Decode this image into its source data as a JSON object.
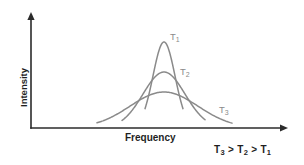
{
  "chart_data": {
    "type": "line",
    "title": "",
    "xlabel": "Frequency",
    "ylabel": "Intensity",
    "grid": false,
    "legend": "inline-curve-labels",
    "axis_style": "arrow-ended L-shaped axes, no tick marks, no numeric scale",
    "annotation": "T3 > T2 > T1",
    "annotation_parts": {
      "t3": "T",
      "t3_sub": "3",
      "op1": " > ",
      "t2": "T",
      "t2_sub": "2",
      "op2": " > ",
      "t1": "T",
      "t1_sub": "1"
    },
    "curve_color": "#8a8a8a",
    "axis_color": "#2b2b2b",
    "background_color": "#ffffff",
    "shared_peak_x": 164,
    "baseline_y": 128,
    "series": [
      {
        "name": "T1",
        "label_text": "T",
        "label_sub": "1",
        "label_x": 170,
        "label_y": 32,
        "peak_y": 42,
        "peak_height": 86,
        "half_width": 11,
        "base_left_x": 145,
        "base_right_x": 183,
        "relative_peak_intensity": 1.0,
        "relative_width": 0.28
      },
      {
        "name": "T2",
        "label_text": "T",
        "label_sub": "2",
        "label_x": 180,
        "label_y": 67,
        "peak_y": 72,
        "peak_height": 56,
        "half_width": 21,
        "base_left_x": 122,
        "base_right_x": 205,
        "relative_peak_intensity": 0.65,
        "relative_width": 0.6
      },
      {
        "name": "T3",
        "label_text": "T",
        "label_sub": "3",
        "label_x": 219,
        "label_y": 105,
        "peak_y": 92,
        "peak_height": 36,
        "half_width": 34,
        "base_left_x": 97,
        "base_right_x": 232,
        "relative_peak_intensity": 0.42,
        "relative_width": 1.0
      }
    ],
    "axes_geometry": {
      "origin_x": 31,
      "origin_y": 128,
      "y_axis_top": 14,
      "x_axis_right": 287
    }
  }
}
